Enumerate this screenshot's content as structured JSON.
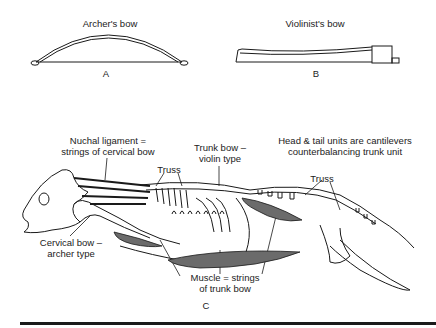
{
  "panel_a": {
    "title": "Archer's bow",
    "letter": "A"
  },
  "panel_b": {
    "title": "Violinist's bow",
    "letter": "B"
  },
  "panel_c": {
    "letter": "C",
    "labels": {
      "nuchal_line1": "Nuchal ligament =",
      "nuchal_line2": "strings of cervical bow",
      "trunk_line1": "Trunk bow –",
      "trunk_line2": "violin type",
      "cantilever_line1": "Head & tail units are cantilevers",
      "cantilever_line2": "counterbalancing trunk unit",
      "truss_front": "Truss",
      "truss_rear": "Truss",
      "cervical_line1": "Cervical bow –",
      "cervical_line2": "archer type",
      "muscle_line1": "Muscle = strings",
      "muscle_line2": "of trunk bow"
    }
  },
  "colors": {
    "ink": "#1a1a1a",
    "muscle_fill": "#6b6b6b",
    "background": "#ffffff"
  }
}
